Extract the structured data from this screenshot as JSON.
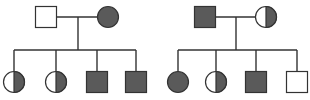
{
  "diagram": {
    "type": "pedigree",
    "colors": {
      "affected": "#5a5a5a",
      "unaffected": "#ffffff",
      "stroke": "#333333",
      "line": "#333333"
    },
    "families": [
      {
        "id": "left",
        "parents": [
          {
            "sex": "male",
            "status": "unaffected",
            "x": 46,
            "y": 17
          },
          {
            "sex": "female",
            "status": "affected",
            "x": 108,
            "y": 17
          }
        ],
        "drop_x": 78,
        "sibship_y": 50,
        "children": [
          {
            "sex": "female",
            "status": "carrier",
            "x": 14,
            "y": 82
          },
          {
            "sex": "female",
            "status": "carrier",
            "x": 56,
            "y": 82
          },
          {
            "sex": "male",
            "status": "affected",
            "x": 97,
            "y": 82
          },
          {
            "sex": "male",
            "status": "affected",
            "x": 136,
            "y": 82
          }
        ]
      },
      {
        "id": "right",
        "parents": [
          {
            "sex": "male",
            "status": "affected",
            "x": 205,
            "y": 17
          },
          {
            "sex": "female",
            "status": "carrier",
            "x": 266,
            "y": 17
          }
        ],
        "drop_x": 236,
        "sibship_y": 50,
        "children": [
          {
            "sex": "female",
            "status": "affected",
            "x": 178,
            "y": 82
          },
          {
            "sex": "female",
            "status": "carrier",
            "x": 216,
            "y": 82
          },
          {
            "sex": "male",
            "status": "affected",
            "x": 256,
            "y": 82
          },
          {
            "sex": "male",
            "status": "unaffected",
            "x": 297,
            "y": 82
          }
        ]
      }
    ]
  }
}
